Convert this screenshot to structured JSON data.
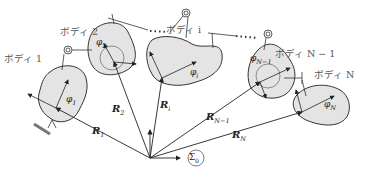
{
  "colors": {
    "body_fill": "#e4e4e4",
    "stroke": "#333333",
    "ground": "#777777",
    "label": "#555555"
  },
  "bodies": [
    {
      "label": "ボディ 1",
      "angle": "φ",
      "angle_sub": "1",
      "vector": "R",
      "vector_sub": "1"
    },
    {
      "label": "ボディ 2",
      "angle": "φ",
      "angle_sub": "2",
      "vector": "R",
      "vector_sub": "2"
    },
    {
      "label": "ボディ i",
      "angle": "φ",
      "angle_sub": "i",
      "vector": "R",
      "vector_sub": "i"
    },
    {
      "label": "ボディ N − 1",
      "angle": "φ",
      "angle_sub": "N−1",
      "vector": "R",
      "vector_sub": "N−1"
    },
    {
      "label": "ボディ N",
      "angle": "φ",
      "angle_sub": "N",
      "vector": "R",
      "vector_sub": "N"
    }
  ],
  "base_frame": {
    "symbol": "Σ",
    "sub": "0"
  }
}
